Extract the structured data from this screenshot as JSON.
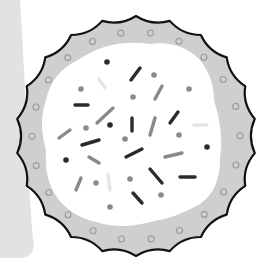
{
  "colors": {
    "background": "#ffffff",
    "side_panel": "#e2e2e2",
    "crust": "#cfcfcf",
    "outline": "#111111",
    "icing": "#ffffff",
    "dark_sprinkle": "#2b2b2b",
    "mid_sprinkle": "#8a8a8a",
    "light_sprinkle": "#e6e6e6",
    "crust_dot": "#9a9a9a"
  },
  "cookie": {
    "center": [
      136,
      136
    ],
    "outer_radius": 120,
    "scallops": 22,
    "crust_dots": 22
  },
  "sprinkles": {
    "dots": [
      {
        "x": 107,
        "y": 62,
        "tone": "dark"
      },
      {
        "x": 110,
        "y": 125,
        "tone": "dark"
      },
      {
        "x": 66,
        "y": 160,
        "tone": "dark"
      },
      {
        "x": 207,
        "y": 147,
        "tone": "dark"
      },
      {
        "x": 154,
        "y": 75,
        "tone": "mid"
      },
      {
        "x": 81,
        "y": 89,
        "tone": "mid"
      },
      {
        "x": 133,
        "y": 97,
        "tone": "mid"
      },
      {
        "x": 189,
        "y": 89,
        "tone": "mid"
      },
      {
        "x": 86,
        "y": 128,
        "tone": "mid"
      },
      {
        "x": 125,
        "y": 139,
        "tone": "mid"
      },
      {
        "x": 179,
        "y": 135,
        "tone": "mid"
      },
      {
        "x": 96,
        "y": 183,
        "tone": "mid"
      },
      {
        "x": 130,
        "y": 179,
        "tone": "mid"
      },
      {
        "x": 161,
        "y": 195,
        "tone": "mid"
      },
      {
        "x": 110,
        "y": 207,
        "tone": "mid"
      }
    ],
    "dashes": [
      {
        "x1": 131,
        "y1": 80,
        "x2": 140,
        "y2": 68,
        "tone": "dark"
      },
      {
        "x1": 99,
        "y1": 79,
        "x2": 105,
        "y2": 88,
        "tone": "light"
      },
      {
        "x1": 155,
        "y1": 99,
        "x2": 162,
        "y2": 86,
        "tone": "mid"
      },
      {
        "x1": 75,
        "y1": 105,
        "x2": 88,
        "y2": 105,
        "tone": "dark"
      },
      {
        "x1": 97,
        "y1": 123,
        "x2": 113,
        "y2": 108,
        "tone": "mid"
      },
      {
        "x1": 132,
        "y1": 118,
        "x2": 132,
        "y2": 131,
        "tone": "dark"
      },
      {
        "x1": 150,
        "y1": 135,
        "x2": 155,
        "y2": 118,
        "tone": "mid"
      },
      {
        "x1": 170,
        "y1": 123,
        "x2": 178,
        "y2": 112,
        "tone": "dark"
      },
      {
        "x1": 194,
        "y1": 125,
        "x2": 207,
        "y2": 125,
        "tone": "light"
      },
      {
        "x1": 59,
        "y1": 138,
        "x2": 70,
        "y2": 130,
        "tone": "mid"
      },
      {
        "x1": 82,
        "y1": 145,
        "x2": 99,
        "y2": 140,
        "tone": "dark"
      },
      {
        "x1": 126,
        "y1": 157,
        "x2": 142,
        "y2": 149,
        "tone": "dark"
      },
      {
        "x1": 165,
        "y1": 157,
        "x2": 182,
        "y2": 153,
        "tone": "mid"
      },
      {
        "x1": 89,
        "y1": 157,
        "x2": 99,
        "y2": 163,
        "tone": "mid"
      },
      {
        "x1": 150,
        "y1": 169,
        "x2": 162,
        "y2": 183,
        "tone": "dark"
      },
      {
        "x1": 180,
        "y1": 177,
        "x2": 195,
        "y2": 177,
        "tone": "dark"
      },
      {
        "x1": 76,
        "y1": 190,
        "x2": 81,
        "y2": 178,
        "tone": "mid"
      },
      {
        "x1": 108,
        "y1": 174,
        "x2": 110,
        "y2": 190,
        "tone": "light"
      },
      {
        "x1": 133,
        "y1": 193,
        "x2": 142,
        "y2": 203,
        "tone": "dark"
      }
    ]
  }
}
